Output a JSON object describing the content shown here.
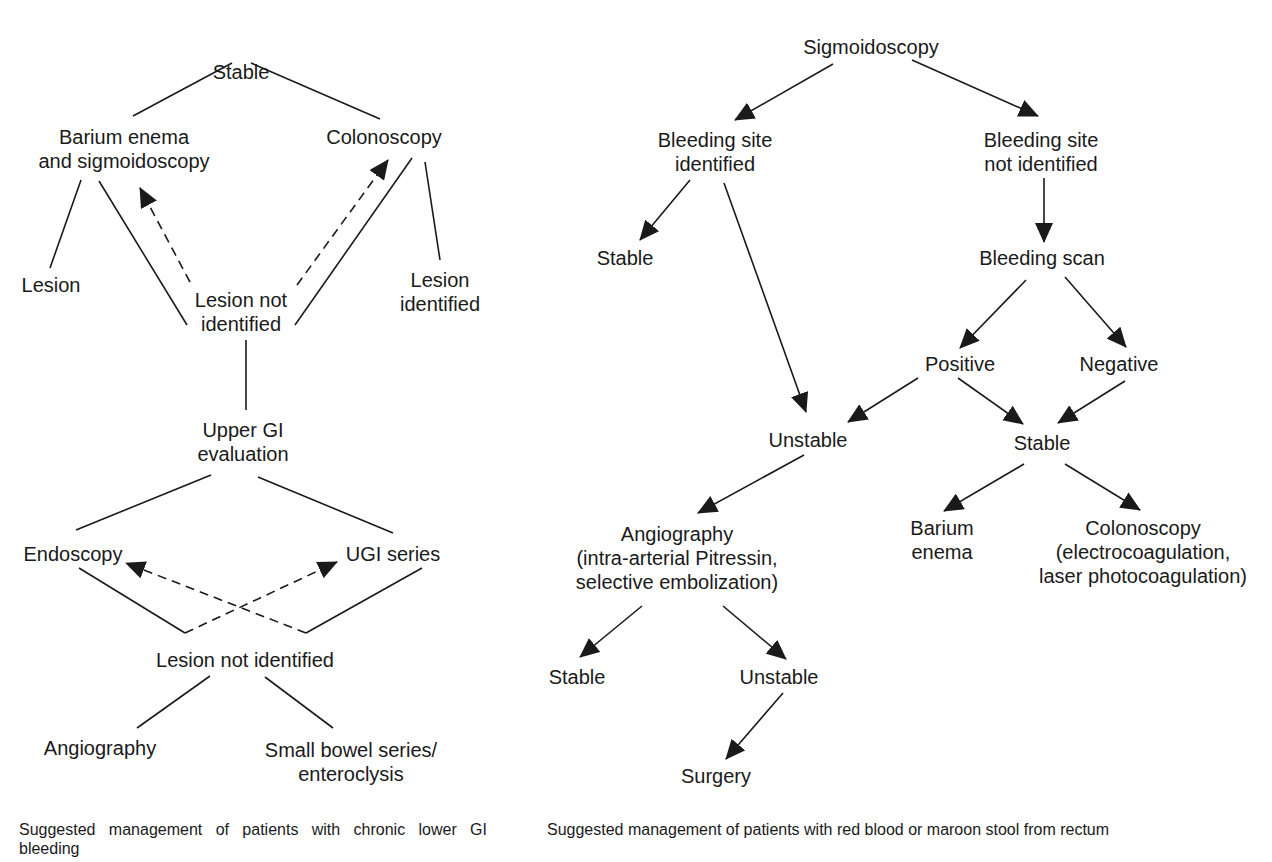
{
  "left_flowchart": {
    "title": "Chronic lower GI bleeding",
    "nodes": {
      "stable": "Stable",
      "barium_enema_sigmoidoscopy": "Barium enema\nand sigmoidoscopy",
      "colonoscopy": "Colonoscopy",
      "lesion": "Lesion",
      "lesion_not_identified_1": "Lesion not\nidentified",
      "lesion_identified": "Lesion\nidentified",
      "upper_gi_evaluation": "Upper GI\nevaluation",
      "endoscopy": "Endoscopy",
      "ugi_series": "UGI series",
      "lesion_not_identified_2": "Lesion not identified",
      "angiography": "Angiography",
      "small_bowel_series": "Small bowel series/\nenteroclysis"
    },
    "edges": [
      {
        "from": "stable",
        "to": "barium_enema_sigmoidoscopy",
        "style": "solid"
      },
      {
        "from": "stable",
        "to": "colonoscopy",
        "style": "solid"
      },
      {
        "from": "barium_enema_sigmoidoscopy",
        "to": "lesion",
        "style": "solid"
      },
      {
        "from": "barium_enema_sigmoidoscopy",
        "to": "lesion_not_identified_1",
        "style": "solid"
      },
      {
        "from": "colonoscopy",
        "to": "lesion_not_identified_1",
        "style": "solid"
      },
      {
        "from": "colonoscopy",
        "to": "lesion_identified",
        "style": "solid"
      },
      {
        "from": "lesion_not_identified_1",
        "to": "barium_enema_sigmoidoscopy",
        "style": "dashed-arrow"
      },
      {
        "from": "lesion_not_identified_1",
        "to": "colonoscopy",
        "style": "dashed-arrow"
      },
      {
        "from": "lesion_not_identified_1",
        "to": "upper_gi_evaluation",
        "style": "solid"
      },
      {
        "from": "upper_gi_evaluation",
        "to": "endoscopy",
        "style": "solid"
      },
      {
        "from": "upper_gi_evaluation",
        "to": "ugi_series",
        "style": "solid"
      },
      {
        "from": "endoscopy",
        "to": "lesion_not_identified_2",
        "style": "solid"
      },
      {
        "from": "ugi_series",
        "to": "lesion_not_identified_2",
        "style": "solid"
      },
      {
        "from": "lesion_not_identified_2",
        "to": "endoscopy",
        "style": "dashed-arrow"
      },
      {
        "from": "lesion_not_identified_2",
        "to": "ugi_series",
        "style": "dashed-arrow"
      },
      {
        "from": "lesion_not_identified_2",
        "to": "angiography",
        "style": "solid"
      },
      {
        "from": "lesion_not_identified_2",
        "to": "small_bowel_series",
        "style": "solid"
      }
    ],
    "caption": "Suggested management of patients with chronic lower GI bleeding"
  },
  "right_flowchart": {
    "title": "Red blood or maroon stool from rectum",
    "nodes": {
      "sigmoidoscopy": "Sigmoidoscopy",
      "bleeding_site_identified": "Bleeding site\nidentified",
      "bleeding_site_not_identified": "Bleeding site\nnot identified",
      "stable_1": "Stable",
      "bleeding_scan": "Bleeding scan",
      "positive": "Positive",
      "negative": "Negative",
      "unstable_1": "Unstable",
      "stable_2": "Stable",
      "angiography": "Angiography\n(intra-arterial Pitressin,\nselective embolization)",
      "barium_enema": "Barium\nenema",
      "colonoscopy": "Colonoscopy\n(electrocoagulation,\nlaser photocoagulation)",
      "stable_3": "Stable",
      "unstable_2": "Unstable",
      "surgery": "Surgery"
    },
    "edges": [
      {
        "from": "sigmoidoscopy",
        "to": "bleeding_site_identified",
        "style": "arrow"
      },
      {
        "from": "sigmoidoscopy",
        "to": "bleeding_site_not_identified",
        "style": "arrow"
      },
      {
        "from": "bleeding_site_identified",
        "to": "stable_1",
        "style": "arrow"
      },
      {
        "from": "bleeding_site_identified",
        "to": "unstable_1",
        "style": "arrow"
      },
      {
        "from": "bleeding_site_not_identified",
        "to": "bleeding_scan",
        "style": "arrow"
      },
      {
        "from": "bleeding_scan",
        "to": "positive",
        "style": "arrow"
      },
      {
        "from": "bleeding_scan",
        "to": "negative",
        "style": "arrow"
      },
      {
        "from": "positive",
        "to": "unstable_1",
        "style": "arrow"
      },
      {
        "from": "positive",
        "to": "stable_2",
        "style": "arrow"
      },
      {
        "from": "negative",
        "to": "stable_2",
        "style": "arrow"
      },
      {
        "from": "unstable_1",
        "to": "angiography",
        "style": "arrow"
      },
      {
        "from": "stable_2",
        "to": "barium_enema",
        "style": "arrow"
      },
      {
        "from": "stable_2",
        "to": "colonoscopy",
        "style": "arrow"
      },
      {
        "from": "angiography",
        "to": "stable_3",
        "style": "arrow"
      },
      {
        "from": "angiography",
        "to": "unstable_2",
        "style": "arrow"
      },
      {
        "from": "unstable_2",
        "to": "surgery",
        "style": "arrow"
      }
    ],
    "caption": "Suggested management of patients with red blood or maroon stool from rectum"
  },
  "colors": {
    "ink": "#1a1a1a",
    "background": "#ffffff"
  }
}
